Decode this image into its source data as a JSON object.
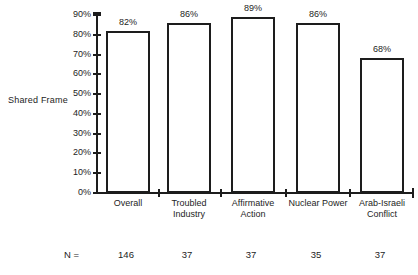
{
  "chart_data": {
    "type": "bar",
    "title": "",
    "ylabel": "Shared Frame",
    "xlabel": "",
    "categories": [
      "Overall",
      "Troubled\nIndustry",
      "Affirmative\nAction",
      "Nuclear Power",
      "Arab-Israeli\nConflict"
    ],
    "values": [
      82,
      86,
      89,
      86,
      68
    ],
    "value_labels": [
      "82%",
      "86%",
      "89%",
      "86%",
      "68%"
    ],
    "ylim": [
      0,
      90
    ],
    "ytick_step": 10,
    "ytick_labels": [
      "0%",
      "10%",
      "20%",
      "30%",
      "40%",
      "50%",
      "60%",
      "70%",
      "80%",
      "90%"
    ],
    "grid": false,
    "legend_position": "none",
    "sample_row": {
      "label": "N =",
      "values": [
        "146",
        "37",
        "37",
        "35",
        "37"
      ]
    },
    "colors": {
      "bar_fill": "#ffffff",
      "bar_border": "#1d1d1d",
      "axis": "#1d1d1d",
      "text": "#1d1d1d"
    }
  }
}
